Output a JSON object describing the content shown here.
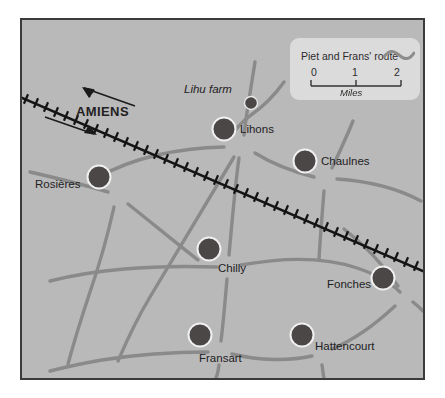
{
  "map": {
    "title": "Piet and Frans' route map",
    "background_color": "#b9b9b9",
    "border_color": "#3b3b3b",
    "road_color": "#8a8a8a",
    "node_color": "#4a4746",
    "node_ring_color": "#f0f0f0",
    "railway_color": "#1a1a1a",
    "label_color": "#23211f"
  },
  "legend": {
    "route_label": "Piet and Frans' route",
    "scale": {
      "ticks": [
        "0",
        "1",
        "2"
      ],
      "unit": "Miles"
    }
  },
  "direction_marker": {
    "label": "AMIENS",
    "arrow_out": "arrow-left-icon",
    "arrow_in": "arrow-right-icon"
  },
  "places": [
    {
      "name": "Lihu farm",
      "kind": "farm",
      "x": 229,
      "y": 101,
      "r": 6.5,
      "label_x": 182,
      "label_y": 82
    },
    {
      "name": "Lihons",
      "kind": "town",
      "x": 222,
      "y": 127,
      "r": 11.5,
      "label_x": 238,
      "label_y": 122
    },
    {
      "name": "Chaulnes",
      "kind": "town",
      "x": 303,
      "y": 159,
      "r": 11.5,
      "label_x": 319,
      "label_y": 154
    },
    {
      "name": "Rosières",
      "kind": "town",
      "x": 97,
      "y": 175,
      "r": 11.5,
      "label_x": 33,
      "label_y": 177
    },
    {
      "name": "Chilly",
      "kind": "town",
      "x": 207,
      "y": 247,
      "r": 11.5,
      "label_x": 216,
      "label_y": 261
    },
    {
      "name": "Fonches",
      "kind": "town",
      "x": 381,
      "y": 276,
      "r": 11.5,
      "label_x": 325,
      "label_y": 277
    },
    {
      "name": "Fransart",
      "kind": "town",
      "x": 198,
      "y": 333,
      "r": 11.5,
      "label_x": 197,
      "label_y": 351
    },
    {
      "name": "Hattencourt",
      "kind": "town",
      "x": 300,
      "y": 333,
      "r": 11.5,
      "label_x": 313,
      "label_y": 339
    }
  ]
}
